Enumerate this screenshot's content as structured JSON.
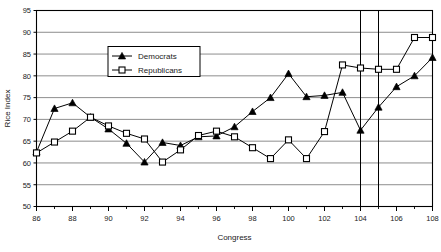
{
  "chart_data": {
    "type": "line",
    "title": "",
    "xlabel": "Congress",
    "ylabel": "Rice Index",
    "xlim": [
      86,
      108
    ],
    "ylim": [
      50,
      95
    ],
    "xticks": [
      86,
      88,
      90,
      92,
      94,
      96,
      98,
      100,
      102,
      104,
      106,
      108
    ],
    "xminorticks": [
      87,
      89,
      91,
      93,
      95,
      97,
      99,
      101,
      103,
      105,
      107
    ],
    "yticks": [
      50,
      55,
      60,
      65,
      70,
      75,
      80,
      85,
      90,
      95
    ],
    "grid": "horizontal",
    "legend_position": "upper-left-center",
    "x": [
      86,
      87,
      88,
      89,
      90,
      91,
      92,
      93,
      94,
      95,
      96,
      97,
      98,
      99,
      100,
      101,
      102,
      103,
      104,
      105,
      106,
      107,
      108
    ],
    "series": [
      {
        "name": "Democrats",
        "marker": "filled-triangle",
        "color": "#000000",
        "values": [
          62.5,
          72.5,
          73.8,
          70.5,
          67.8,
          64.5,
          60.2,
          64.7,
          64.0,
          66.0,
          66.2,
          68.3,
          71.8,
          75.0,
          80.5,
          75.2,
          75.5,
          76.2,
          67.5,
          72.8,
          77.5,
          80.0,
          84.2
        ]
      },
      {
        "name": "Republicans",
        "marker": "open-square",
        "color": "#000000",
        "values": [
          62.3,
          64.8,
          67.3,
          70.5,
          68.5,
          66.8,
          65.5,
          60.2,
          63.0,
          66.3,
          67.3,
          66.0,
          63.5,
          61.0,
          65.3,
          61.0,
          67.2,
          82.5,
          81.8,
          81.5,
          81.5,
          88.8,
          88.8
        ]
      }
    ],
    "reference_lines": [
      {
        "x": 104,
        "orientation": "vertical"
      },
      {
        "x": 105,
        "orientation": "vertical"
      }
    ]
  },
  "legend": {
    "entries": [
      {
        "label": "Democrats",
        "marker": "filled-triangle"
      },
      {
        "label": "Republicans",
        "marker": "open-square"
      }
    ]
  },
  "axes": {
    "x_title": "Congress",
    "y_title": "Rice Index"
  }
}
